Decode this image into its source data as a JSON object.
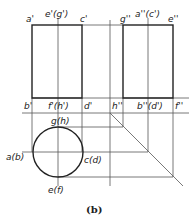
{
  "caption": "(b)",
  "front_view": {
    "labels": {
      "a": "a'",
      "eg": "e'(g')",
      "c": "c'",
      "b": "b'",
      "fh": "f'(h')",
      "d": "d'"
    }
  },
  "side_view": {
    "labels": {
      "g": "g''",
      "ac": "a''(c')",
      "e": "e''",
      "h": "h''",
      "bd": "b''(d')",
      "f": "f''"
    }
  },
  "top_view": {
    "labels": {
      "gh": "g(h)",
      "ab": "a(b)",
      "cd": "c(d)",
      "ef": "e(f)"
    }
  },
  "colors": {
    "line": "#222222",
    "thin": "#555555"
  }
}
